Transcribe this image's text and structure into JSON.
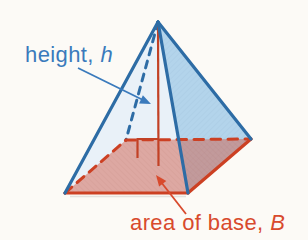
{
  "figure": {
    "kind": "pyramid-volume-diagram",
    "labels": {
      "height": {
        "prefix": "height, ",
        "symbol": "h"
      },
      "base": {
        "prefix": "area of base, ",
        "symbol": "B"
      }
    },
    "colors": {
      "height_label": "#3a7abc",
      "base_label": "#d84a2d",
      "edge_blue": "#2d6ca5",
      "edge_red": "#cc4023",
      "height_line_red": "#c24125",
      "face_left_fill": "#e9f1f8",
      "face_right_fill": "#b3d4eb",
      "base_overlay_fill": "#d2604b",
      "background": "#fcfaf6"
    }
  }
}
